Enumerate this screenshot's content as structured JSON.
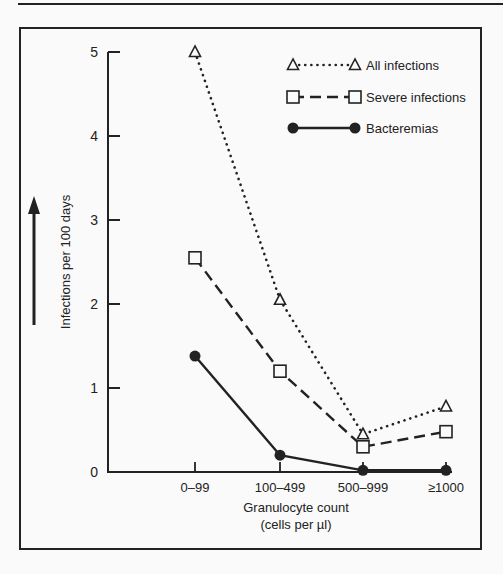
{
  "chart_data": {
    "type": "line",
    "title": "",
    "xlabel": "Granulocyte count",
    "xlabel_sub": "(cells per µl)",
    "ylabel": "Infections per 100 days",
    "categories": [
      "0–99",
      "100–499",
      "500–999",
      "≥1000"
    ],
    "yticks": [
      "0",
      "1",
      "2",
      "3",
      "4",
      "5"
    ],
    "ylim": [
      0,
      5
    ],
    "grid": false,
    "legend_position": "upper right",
    "series": [
      {
        "name": "All infections",
        "marker": "open-triangle",
        "line": "dotted",
        "values": [
          5.0,
          2.05,
          0.45,
          0.78
        ]
      },
      {
        "name": "Severe infections",
        "marker": "open-square",
        "line": "dashed",
        "values": [
          2.55,
          1.2,
          0.3,
          0.48
        ]
      },
      {
        "name": "Bacteremias",
        "marker": "filled-circle",
        "line": "solid",
        "values": [
          1.38,
          0.2,
          0.02,
          0.02
        ]
      }
    ]
  },
  "colors": {
    "ink": "#222222",
    "paper": "#fafafa"
  }
}
